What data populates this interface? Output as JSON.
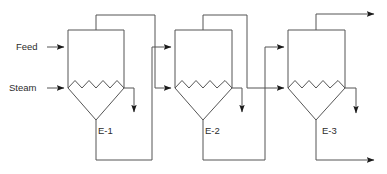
{
  "diagram": {
    "type": "process-flow-diagram",
    "canvas": {
      "width": 387,
      "height": 174,
      "background": "#ffffff"
    },
    "line_color": "#555555",
    "line_width": 1,
    "arrow_color": "#1a1a1a",
    "text_color": "#2c2c2c"
  },
  "stream_labels": {
    "feed": "Feed",
    "steam": "Steam"
  },
  "vessels": [
    {
      "id": "E-1",
      "label": "E-1",
      "body": {
        "x": 68,
        "y": 30,
        "width": 56,
        "height": 58
      },
      "cone_apex": {
        "x": 96,
        "y": 120
      },
      "coil_peaks": 4,
      "label_pos": {
        "x": 98,
        "y": 131
      }
    },
    {
      "id": "E-2",
      "label": "E-2",
      "body": {
        "x": 175,
        "y": 30,
        "width": 57,
        "height": 58
      },
      "cone_apex": {
        "x": 203,
        "y": 120
      },
      "coil_peaks": 4,
      "label_pos": {
        "x": 205,
        "y": 131
      }
    },
    {
      "id": "E-3",
      "label": "E-3",
      "body": {
        "x": 288,
        "y": 30,
        "width": 57,
        "height": 58
      },
      "cone_apex": {
        "x": 316,
        "y": 120
      },
      "coil_peaks": 4,
      "label_pos": {
        "x": 320,
        "y": 131
      }
    }
  ],
  "streams": [
    {
      "name": "feed-inlet",
      "from": "Feed label",
      "to": "E-1 shell",
      "terminus": "arrow-right"
    },
    {
      "name": "steam-inlet",
      "from": "Steam label",
      "to": "E-1 coil",
      "terminus": "arrow-right"
    },
    {
      "name": "e1-condensate",
      "from": "E-1 coil",
      "to": "drain",
      "terminus": "arrow-down"
    },
    {
      "name": "e1-vapor",
      "from": "E-1 top",
      "to": "E-2 coil",
      "terminus": "arrow-right"
    },
    {
      "name": "e1-liquor",
      "from": "E-1 bottom",
      "to": "E-2 shell",
      "terminus": "arrow-right"
    },
    {
      "name": "e2-condensate",
      "from": "E-2 coil",
      "to": "drain",
      "terminus": "arrow-down"
    },
    {
      "name": "e2-vapor",
      "from": "E-2 top",
      "to": "E-3 coil",
      "terminus": "arrow-right"
    },
    {
      "name": "e2-liquor",
      "from": "E-2 bottom",
      "to": "E-3 shell",
      "terminus": "arrow-right"
    },
    {
      "name": "e3-vapor-out",
      "from": "E-3 top",
      "to": "vapor outlet",
      "terminus": "arrow-right"
    },
    {
      "name": "e3-condensate",
      "from": "E-3 coil",
      "to": "drain",
      "terminus": "arrow-down"
    },
    {
      "name": "e3-product-out",
      "from": "E-3 bottom",
      "to": "product outlet",
      "terminus": "arrow-right"
    }
  ]
}
